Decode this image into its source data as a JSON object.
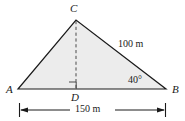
{
  "figure": {
    "kind": "geometry-triangle-diagram",
    "vertices": {
      "apex_label": "C",
      "left_label": "A",
      "right_label": "B",
      "foot_label": "D"
    },
    "measures": {
      "side_cb": "100 m",
      "angle_b": "40°",
      "base_ab": "150 m"
    },
    "colors": {
      "fill": "#ececec",
      "stroke": "#1a1a1a",
      "text": "#1a1a1a",
      "background": "#ffffff"
    },
    "geometry": {
      "A": [
        18,
        89
      ],
      "B": [
        166,
        89
      ],
      "C": [
        76,
        20
      ],
      "D": [
        76,
        89
      ],
      "altitude_style": "dashed",
      "right_angle_at": "D",
      "dimension_line_y": 110,
      "dimension_line_x1": 19,
      "dimension_line_x2": 166
    }
  }
}
